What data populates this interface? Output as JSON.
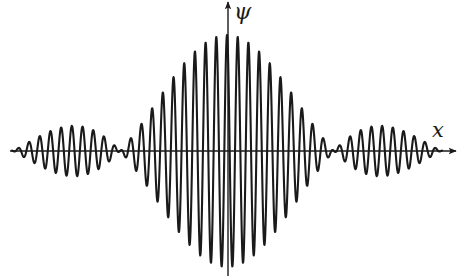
{
  "figure": {
    "type": "wave-packet",
    "labels": {
      "y_axis": "ψ",
      "x_axis": "x"
    },
    "colors": {
      "curve": "#1a1a1a",
      "axes": "#1a1a1a",
      "background": "#ffffff"
    },
    "geometry": {
      "origin_x": 227,
      "axis_y": 151,
      "x_axis_start": 10,
      "x_axis_end": 456,
      "y_axis_top": 2,
      "y_axis_bottom": 276,
      "curve_x_start": 12,
      "curve_x_end": 442,
      "envelope_amplitude_px": 116,
      "envelope_half_width_px": 107,
      "carrier_period_px": 10.7,
      "carrier_phase_px": 0
    },
    "envelope": {
      "function": "sinc",
      "main_lobe_nodes_x": [
        120,
        334
      ],
      "side_lobe_extents_x": [
        [
          13,
          120
        ],
        [
          334,
          441
        ]
      ],
      "side_lobe_relative_amplitude": 0.217
    }
  }
}
